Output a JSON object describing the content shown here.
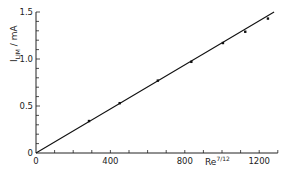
{
  "chart_data": {
    "type": "scatter",
    "title": "",
    "xlabel": "Re^7/12",
    "ylabel": "I_LIM / mA",
    "xlim": [
      0,
      1300
    ],
    "ylim": [
      0,
      1.5
    ],
    "x_ticks": [
      0,
      400,
      800,
      1200
    ],
    "y_ticks": [
      0,
      0.5,
      1.0,
      1.5
    ],
    "x_tick_labels": [
      "0",
      "400",
      "800",
      "1200"
    ],
    "y_tick_labels": [
      "0",
      "0.5",
      "1.0",
      "1.5"
    ],
    "x_minor_step": 100,
    "y_minor_step": 0.1,
    "grid": false,
    "legend": null,
    "series": [
      {
        "name": "measured",
        "style": "points",
        "x": [
          285,
          450,
          655,
          835,
          1005,
          1125,
          1247
        ],
        "y": [
          0.34,
          0.53,
          0.77,
          0.97,
          1.17,
          1.29,
          1.43
        ]
      },
      {
        "name": "fit",
        "style": "line",
        "x": [
          0,
          1280
        ],
        "y": [
          0,
          1.5
        ]
      }
    ]
  },
  "labels": {
    "ylabel_main": "I",
    "ylabel_sub": "LIM",
    "ylabel_unit": " / mA",
    "xlabel_main": "Re",
    "xlabel_sup": "7/12"
  }
}
